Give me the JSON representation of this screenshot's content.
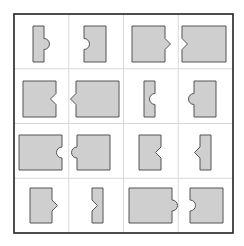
{
  "figure": {
    "rows": 4,
    "cols": 4,
    "frame": {
      "x": 14,
      "y": 14,
      "w": 219,
      "h": 219
    },
    "colors": {
      "fill": "#cfcfcf",
      "stroke": "#555555",
      "frame": "#222222",
      "grid": "#d8d8d8"
    },
    "cells": [
      {
        "row": 0,
        "col": 0,
        "x": 33,
        "y": 26,
        "w": 11,
        "h": 36,
        "feature": "semicircle",
        "side": "right",
        "direction": "bump"
      },
      {
        "row": 0,
        "col": 1,
        "x": 84,
        "y": 26,
        "w": 22,
        "h": 36,
        "feature": "semicircle",
        "side": "left",
        "direction": "notch"
      },
      {
        "row": 0,
        "col": 2,
        "x": 132,
        "y": 26,
        "w": 33,
        "h": 36,
        "feature": "triangle",
        "side": "right",
        "direction": "bump"
      },
      {
        "row": 0,
        "col": 3,
        "x": 182,
        "y": 26,
        "w": 44,
        "h": 36,
        "feature": "triangle",
        "side": "left",
        "direction": "notch"
      },
      {
        "row": 1,
        "col": 0,
        "x": 23,
        "y": 81,
        "w": 33,
        "h": 36,
        "feature": "triangle",
        "side": "right",
        "direction": "notch"
      },
      {
        "row": 1,
        "col": 1,
        "x": 76,
        "y": 81,
        "w": 43,
        "h": 36,
        "feature": "triangle",
        "side": "left",
        "direction": "bump"
      },
      {
        "row": 1,
        "col": 2,
        "x": 144,
        "y": 81,
        "w": 11,
        "h": 36,
        "feature": "semicircle",
        "side": "right",
        "direction": "notch"
      },
      {
        "row": 1,
        "col": 3,
        "x": 194,
        "y": 81,
        "w": 22,
        "h": 36,
        "feature": "semicircle",
        "side": "left",
        "direction": "bump"
      },
      {
        "row": 2,
        "col": 0,
        "x": 19,
        "y": 135,
        "w": 43,
        "h": 35,
        "feature": "semicircle",
        "side": "right",
        "direction": "notch"
      },
      {
        "row": 2,
        "col": 1,
        "x": 77,
        "y": 135,
        "w": 33,
        "h": 35,
        "feature": "semicircle",
        "side": "left",
        "direction": "bump"
      },
      {
        "row": 2,
        "col": 2,
        "x": 139,
        "y": 135,
        "w": 22,
        "h": 35,
        "feature": "triangle",
        "side": "right",
        "direction": "notch"
      },
      {
        "row": 2,
        "col": 3,
        "x": 200,
        "y": 135,
        "w": 11,
        "h": 35,
        "feature": "triangle",
        "side": "left",
        "direction": "bump"
      },
      {
        "row": 3,
        "col": 0,
        "x": 30,
        "y": 188,
        "w": 22,
        "h": 35,
        "feature": "triangle",
        "side": "right",
        "direction": "bump"
      },
      {
        "row": 3,
        "col": 1,
        "x": 92,
        "y": 188,
        "w": 11,
        "h": 35,
        "feature": "triangle",
        "side": "left",
        "direction": "notch"
      },
      {
        "row": 3,
        "col": 2,
        "x": 129,
        "y": 188,
        "w": 43,
        "h": 35,
        "feature": "semicircle",
        "side": "right",
        "direction": "bump"
      },
      {
        "row": 3,
        "col": 3,
        "x": 190,
        "y": 188,
        "w": 33,
        "h": 35,
        "feature": "semicircle",
        "side": "left",
        "direction": "notch"
      }
    ]
  }
}
